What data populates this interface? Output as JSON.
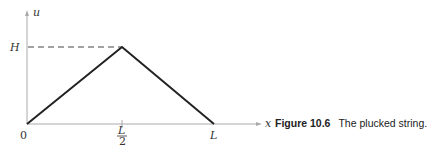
{
  "figure": {
    "axes": {
      "y_label": "u",
      "x_label": "x",
      "origin_label": "0",
      "y_tick_label": "H",
      "x_tick_mid_numerator": "L",
      "x_tick_mid_denominator": "2",
      "x_tick_end_label": "L"
    },
    "curve": {
      "points": [
        [
          0,
          0
        ],
        [
          "L/2",
          "H"
        ],
        [
          "L",
          0
        ]
      ],
      "color": "#222222"
    },
    "axis_color": "#aaaaaa",
    "dashed_guide_color": "#444444"
  },
  "caption": {
    "number": "Figure 10.6",
    "text": "The plucked string."
  }
}
